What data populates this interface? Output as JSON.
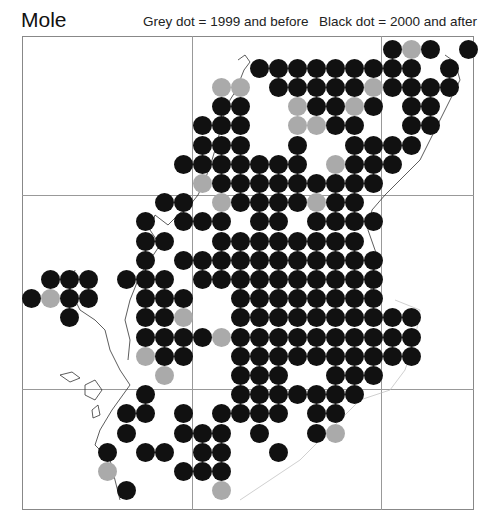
{
  "title": "Mole",
  "legend": {
    "grey": "Grey dot = 1999 and before",
    "black": "Black dot = 2000 and after"
  },
  "colors": {
    "black": "#111111",
    "grey": "#aaaaaa",
    "grid": "#999999"
  },
  "grid": {
    "col0_x": 145,
    "col_step": 19,
    "row0_y": 49,
    "row_step": 19.2
  },
  "rows": [
    {
      "b": [
        13,
        15,
        17
      ],
      "g": [
        14
      ]
    },
    {
      "b": [
        6,
        7,
        8,
        9,
        10,
        11,
        12,
        13,
        14,
        16
      ],
      "g": []
    },
    {
      "b": [
        7,
        8,
        9,
        10,
        11,
        13,
        14,
        15,
        16
      ],
      "g": [
        4,
        5,
        12
      ]
    },
    {
      "b": [
        4,
        5,
        9,
        10,
        12,
        14,
        15
      ],
      "g": [
        8,
        11
      ]
    },
    {
      "b": [
        3,
        4,
        5,
        10,
        11,
        14,
        15
      ],
      "g": [
        8,
        9
      ]
    },
    {
      "b": [
        3,
        4,
        5,
        8,
        11,
        12,
        13,
        14
      ],
      "g": []
    },
    {
      "b": [
        2,
        3,
        4,
        5,
        6,
        7,
        8,
        11,
        12,
        13
      ],
      "g": [
        10
      ]
    },
    {
      "b": [
        4,
        5,
        6,
        7,
        8,
        9,
        10,
        11,
        12
      ],
      "g": [
        3
      ]
    },
    {
      "b": [
        1,
        2,
        5,
        6,
        7,
        8,
        10,
        11
      ],
      "g": [
        4,
        9
      ]
    },
    {
      "b": [
        0,
        2,
        3,
        4,
        6,
        7,
        9,
        10,
        11,
        12
      ],
      "g": []
    },
    {
      "b": [
        0,
        1,
        4,
        5,
        6,
        7,
        8,
        9,
        10,
        11
      ],
      "g": []
    },
    {
      "b": [
        0,
        2,
        3,
        4,
        5,
        6,
        7,
        8,
        9,
        10,
        11,
        12
      ],
      "g": []
    },
    {
      "b": [
        -5,
        -4,
        -3,
        -1,
        0,
        1,
        3,
        4,
        5,
        6,
        7,
        8,
        9,
        10,
        11,
        12
      ],
      "g": []
    },
    {
      "b": [
        -6,
        -4,
        -3,
        0,
        1,
        2,
        5,
        6,
        7,
        8,
        9,
        10,
        11,
        12
      ],
      "g": [
        -5
      ]
    },
    {
      "b": [
        -4,
        0,
        1,
        5,
        6,
        7,
        8,
        9,
        10,
        11,
        12,
        13,
        14
      ],
      "g": [
        2
      ]
    },
    {
      "b": [
        0,
        1,
        2,
        3,
        5,
        6,
        7,
        8,
        9,
        10,
        11,
        12,
        13,
        14
      ],
      "g": [
        4
      ]
    },
    {
      "b": [
        1,
        2,
        5,
        6,
        7,
        8,
        9,
        10,
        11,
        12,
        13,
        14
      ],
      "g": [
        0
      ]
    },
    {
      "b": [
        5,
        6,
        7,
        10,
        11,
        12
      ],
      "g": [
        1
      ]
    },
    {
      "b": [
        0,
        5,
        6,
        7,
        8,
        9,
        10,
        11
      ],
      "g": []
    },
    {
      "b": [
        -1,
        0,
        2,
        4,
        5,
        6,
        7,
        9,
        10
      ],
      "g": []
    },
    {
      "b": [
        -1,
        2,
        3,
        4,
        6,
        9
      ],
      "g": [
        10
      ]
    },
    {
      "b": [
        -2,
        0,
        1,
        3,
        4,
        7
      ],
      "g": []
    },
    {
      "b": [
        2,
        3,
        4
      ],
      "g": [
        -2
      ]
    },
    {
      "b": [
        -1
      ],
      "g": [
        4
      ]
    }
  ]
}
